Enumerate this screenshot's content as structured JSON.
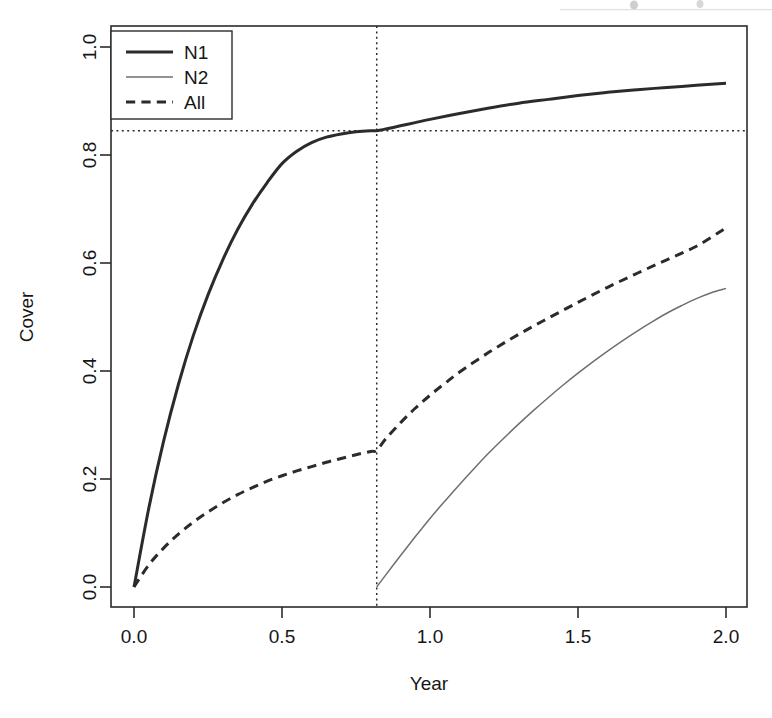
{
  "figure": {
    "background": "#ffffff",
    "ink_color": "#2b2b2b",
    "n2_color": "#6f6f6f"
  },
  "chart_data": {
    "type": "line",
    "title": "",
    "xlabel": "Year",
    "ylabel": "Cover",
    "xlim": [
      -0.08,
      2.08
    ],
    "ylim": [
      -0.042,
      1.042
    ],
    "grid": false,
    "xticks": [
      0.0,
      0.5,
      1.0,
      1.5,
      2.0
    ],
    "xtick_labels": [
      "0.0",
      "0.5",
      "1.0",
      "1.5",
      "2.0"
    ],
    "yticks": [
      0.0,
      0.2,
      0.4,
      0.6,
      0.8,
      1.0
    ],
    "ytick_labels": [
      "0.0",
      "0.2",
      "0.4",
      "0.6",
      "0.8",
      "1.0"
    ],
    "legend": {
      "position": "top-left",
      "entries": [
        {
          "label": "N1",
          "style": "solid",
          "width": 2.0,
          "color": "#2b2b2b"
        },
        {
          "label": "N2",
          "style": "solid",
          "width": 1.0,
          "color": "#6f6f6f"
        },
        {
          "label": "All",
          "style": "dashed",
          "width": 2.0,
          "color": "#2b2b2b"
        }
      ]
    },
    "reference_lines": [
      {
        "name": "vertical-threshold",
        "orientation": "vertical",
        "value": 0.82,
        "style": "dotted",
        "color": "#2b2b2b"
      },
      {
        "name": "horizontal-threshold",
        "orientation": "horizontal",
        "value": 0.845,
        "style": "dotted",
        "color": "#2b2b2b"
      }
    ],
    "annotations": [
      {
        "name": "intersection",
        "x": 0.82,
        "y": 0.845,
        "text": ""
      }
    ],
    "series": [
      {
        "name": "N1",
        "style": "solid",
        "width": 2.0,
        "color": "#2b2b2b",
        "x": [
          0.0,
          0.05,
          0.1,
          0.15,
          0.2,
          0.25,
          0.3,
          0.35,
          0.4,
          0.45,
          0.5,
          0.55,
          0.6,
          0.65,
          0.7,
          0.75,
          0.8,
          0.82,
          0.85,
          0.9,
          0.95,
          1.0,
          1.1,
          1.2,
          1.3,
          1.4,
          1.5,
          1.6,
          1.7,
          1.8,
          1.9,
          2.0
        ],
        "y": [
          0.0,
          0.146,
          0.27,
          0.375,
          0.465,
          0.541,
          0.606,
          0.662,
          0.709,
          0.749,
          0.784,
          0.807,
          0.823,
          0.833,
          0.839,
          0.843,
          0.845,
          0.845,
          0.848,
          0.854,
          0.86,
          0.866,
          0.877,
          0.887,
          0.896,
          0.903,
          0.91,
          0.916,
          0.921,
          0.925,
          0.929,
          0.933
        ]
      },
      {
        "name": "N2",
        "style": "solid",
        "width": 1.0,
        "color": "#6f6f6f",
        "x": [
          0.82,
          0.85,
          0.9,
          0.95,
          1.0,
          1.05,
          1.1,
          1.15,
          1.2,
          1.25,
          1.3,
          1.35,
          1.4,
          1.45,
          1.5,
          1.55,
          1.6,
          1.65,
          1.7,
          1.75,
          1.8,
          1.85,
          1.9,
          1.95,
          2.0
        ],
        "y": [
          0.0,
          0.022,
          0.058,
          0.093,
          0.127,
          0.159,
          0.19,
          0.22,
          0.249,
          0.276,
          0.302,
          0.327,
          0.351,
          0.374,
          0.396,
          0.417,
          0.437,
          0.456,
          0.474,
          0.491,
          0.507,
          0.521,
          0.534,
          0.545,
          0.553
        ]
      },
      {
        "name": "All",
        "style": "dashed",
        "width": 2.0,
        "color": "#2b2b2b",
        "x": [
          0.0,
          0.05,
          0.1,
          0.15,
          0.2,
          0.25,
          0.3,
          0.35,
          0.4,
          0.45,
          0.5,
          0.55,
          0.6,
          0.65,
          0.7,
          0.75,
          0.8,
          0.82,
          0.85,
          0.9,
          0.95,
          1.0,
          1.05,
          1.1,
          1.2,
          1.3,
          1.4,
          1.5,
          1.6,
          1.7,
          1.8,
          1.9,
          2.0
        ],
        "y": [
          0.0,
          0.041,
          0.072,
          0.098,
          0.12,
          0.139,
          0.156,
          0.171,
          0.184,
          0.196,
          0.206,
          0.215,
          0.223,
          0.231,
          0.238,
          0.245,
          0.251,
          0.253,
          0.274,
          0.304,
          0.331,
          0.355,
          0.377,
          0.398,
          0.435,
          0.468,
          0.498,
          0.527,
          0.555,
          0.581,
          0.606,
          0.631,
          0.665
        ]
      }
    ]
  },
  "layout": {
    "plot_left_px": 111,
    "plot_right_px": 747,
    "plot_top_px": 26,
    "plot_bottom_px": 607,
    "x0_px": 134,
    "x1_px": 726,
    "y0_px": 587,
    "y1_px": 47,
    "legend_box": {
      "x": 111,
      "y": 31,
      "w": 121,
      "h": 88
    }
  }
}
